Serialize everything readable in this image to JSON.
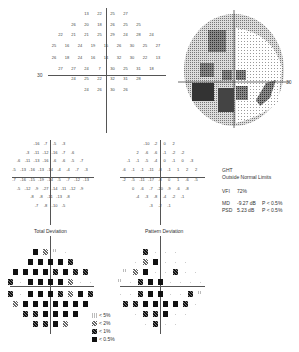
{
  "threshold_map": {
    "axis_label_left": "30",
    "rows": [
      [
        "13",
        "22",
        "25",
        "27"
      ],
      [
        "26",
        "20",
        "18",
        "26",
        "25",
        "25"
      ],
      [
        "22",
        "21",
        "21",
        "25",
        "29",
        "24",
        "28",
        "24"
      ],
      [
        "25",
        "16",
        "24",
        "19",
        "15",
        "26",
        "30",
        "25",
        "27"
      ],
      [
        "26",
        "18",
        "24",
        "16",
        "14",
        "32",
        "30",
        "22",
        "13"
      ],
      [
        "27",
        "27",
        "24",
        "7",
        "30",
        "25",
        "31",
        "18"
      ],
      [
        "24",
        "25",
        "22",
        "32",
        "31",
        "28"
      ],
      [
        "24",
        "26",
        "30",
        "26"
      ]
    ]
  },
  "grayscale_map": {
    "axis_label_right": "30"
  },
  "total_deviation": {
    "title": "Total Deviation",
    "rows": [
      [
        "-16",
        "-7",
        "-5",
        "-3"
      ],
      [
        "-3",
        "-11",
        "-12",
        "-16",
        "-7",
        "-6"
      ],
      [
        "-6",
        "-11",
        "-13",
        "-16",
        "-6",
        "-6",
        "-5",
        "-7"
      ],
      [
        "-5",
        "-13",
        "-16",
        "-13",
        "-14",
        "-4",
        "-4",
        "-7",
        "-3"
      ],
      [
        "-7",
        "-16",
        "-15",
        "-19",
        "-14",
        "-5",
        "-7",
        "-12",
        "-13"
      ],
      [
        "-5",
        "-12",
        "-9",
        "-27",
        "-14",
        "-11",
        "-12",
        "-9"
      ],
      [
        "-8",
        "-8",
        "-11",
        "-13",
        "-8"
      ],
      [
        "-7",
        "-8",
        "-10",
        "-5"
      ]
    ]
  },
  "pattern_deviation": {
    "title": "Pattern Deviation",
    "rows": [
      [
        "-10",
        "-2",
        "0",
        "2"
      ],
      [
        "2",
        "-6",
        "-6",
        "-1",
        "-2",
        "-2"
      ],
      [
        "-1",
        "-1",
        "-5",
        "-4",
        "0",
        "-1",
        "0",
        "-3"
      ],
      [
        "-6",
        "-1",
        "-1",
        "-11",
        "-8",
        "-1",
        "1",
        "2",
        "2"
      ],
      [
        "-2",
        "-5",
        "-11",
        "-17",
        "-8",
        "0",
        "1",
        "-6",
        "-5"
      ],
      [
        "0",
        "-6",
        "-7",
        "-20",
        "-9",
        "-6",
        "-8"
      ],
      [
        "-4",
        "-3",
        "-8",
        "-4",
        "-2",
        "-1"
      ],
      [
        "-3",
        "-2",
        "-1"
      ]
    ]
  },
  "summary": {
    "ght_label": "GHT",
    "ght_value": "Outside Normal Limits",
    "vfi_label": "VFI",
    "vfi_value": "72%",
    "md_label": "MD",
    "md_value": "-9.27 dB",
    "md_p": "P < 0.5%",
    "psd_label": "PSD",
    "psd_value": "5.23 dB",
    "psd_p": "P < 0.5%"
  },
  "legend": [
    {
      "symbol": "light",
      "label": "< 5%"
    },
    {
      "symbol": "med",
      "label": "< 2%"
    },
    {
      "symbol": "dark",
      "label": "< 1%"
    },
    {
      "symbol": "black",
      "label": "< 0.5%"
    }
  ],
  "total_prob": [
    [
      "black",
      "med",
      "light",
      "none"
    ],
    [
      "black",
      "black",
      "black",
      "black",
      "dark"
    ],
    [
      "black",
      "black",
      "black",
      "black",
      "dark",
      "black",
      "dark",
      "dark"
    ],
    [
      "dark",
      "none",
      "black",
      "black",
      "black",
      "black",
      "med",
      "none",
      "none"
    ],
    [
      "dark",
      "none",
      "black",
      "black",
      "black",
      "dark",
      "med",
      "black",
      "dark"
    ],
    [
      "med",
      "black",
      "black",
      "black",
      "black",
      "black",
      "black",
      "black"
    ],
    [
      "dark",
      "dark",
      "black",
      "black",
      "black",
      "black"
    ],
    [
      "dark",
      "dark",
      "black",
      "med"
    ]
  ],
  "pattern_prob": [
    [
      "dark",
      "none",
      "none",
      "none"
    ],
    [
      "none",
      "med",
      "black",
      "none",
      "none",
      "none"
    ],
    [
      "light",
      "med",
      "black",
      "none",
      "none",
      "dark",
      "none",
      "none"
    ],
    [
      "light",
      "none",
      "dark",
      "black",
      "black",
      "none",
      "none",
      "none",
      "none"
    ],
    [
      "none",
      "none",
      "dark",
      "black",
      "black",
      "none",
      "none",
      "dark",
      "light"
    ],
    [
      "dark",
      "dark",
      "black",
      "black",
      "black",
      "black",
      "dark",
      "none"
    ],
    [
      "none",
      "dark",
      "dark",
      "black",
      "none",
      "none"
    ],
    [
      "none",
      "dark",
      "none",
      "none"
    ]
  ]
}
